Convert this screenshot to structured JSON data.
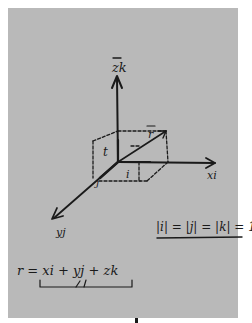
{
  "diagram": {
    "type": "3d-coordinate-axes-sketch",
    "background_color": "#b9b9b9",
    "ink_color": "#1a1a1a",
    "axes": {
      "z": {
        "label": "z",
        "unit_vector": "k"
      },
      "x": {
        "label": "x",
        "unit_vector": "i"
      },
      "y": {
        "label": "y",
        "unit_vector": "j"
      }
    },
    "labels": {
      "z_axis": "zk",
      "x_axis": "xi",
      "y_axis": "yj",
      "r_vector": "r",
      "z_component": "t",
      "x_component": "i",
      "y_component": "j"
    },
    "equations": {
      "unit_norms": "|i| = |j| = |k| = 1",
      "position_vector": "r = xi + yj + zk"
    }
  }
}
